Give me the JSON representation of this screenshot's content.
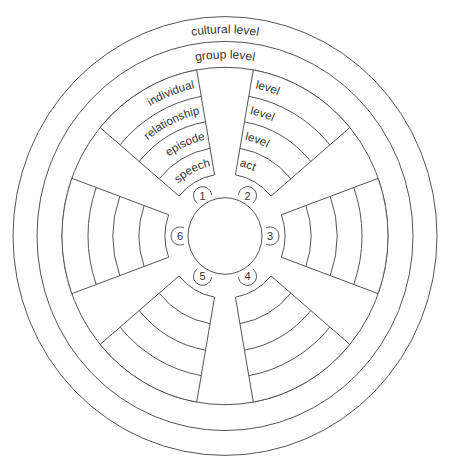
{
  "diagram": {
    "title_rings": {
      "outer": "cultural level",
      "middle": "group level"
    },
    "sector_band_labels": {
      "upper_left": [
        "speech",
        "episode",
        "relationship",
        "individual"
      ],
      "upper_right": [
        "act",
        "level",
        "level",
        "level"
      ]
    },
    "numbers": [
      "1",
      "2",
      "3",
      "4",
      "5",
      "6"
    ],
    "colors": {
      "line": "#555555",
      "text": "#333333",
      "background": "#ffffff"
    },
    "geometry": {
      "center": [
        225,
        236
      ],
      "y_scale": 1.035,
      "outer_radius": 212,
      "cultural_inner_radius": 188,
      "group_inner_radius": 163,
      "sector_band_radii": [
        60,
        86,
        112,
        137,
        163
      ],
      "sector_centers_deg": [
        -120,
        -60,
        0,
        60,
        120,
        180
      ],
      "sector_half_width_deg": 20,
      "hub_radius": 37,
      "bubble_orbit_radius": 45,
      "bubble_radius": 9
    }
  }
}
